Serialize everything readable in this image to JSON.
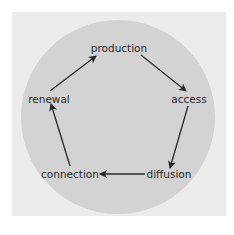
{
  "diagram": {
    "type": "cycle",
    "colors": {
      "frame": "#ececec",
      "circle": "#d3d3d3",
      "arrow": "#2a2a2a",
      "text": "#2a2a2a"
    },
    "nodes": [
      {
        "id": "production",
        "label": "production"
      },
      {
        "id": "access",
        "label": "access"
      },
      {
        "id": "diffusion",
        "label": "diffusion"
      },
      {
        "id": "connection",
        "label": "connection"
      },
      {
        "id": "renewal",
        "label": "renewal"
      }
    ],
    "edges": [
      {
        "from": "production",
        "to": "access"
      },
      {
        "from": "access",
        "to": "diffusion"
      },
      {
        "from": "diffusion",
        "to": "connection"
      },
      {
        "from": "connection",
        "to": "renewal"
      },
      {
        "from": "renewal",
        "to": "production"
      }
    ]
  }
}
